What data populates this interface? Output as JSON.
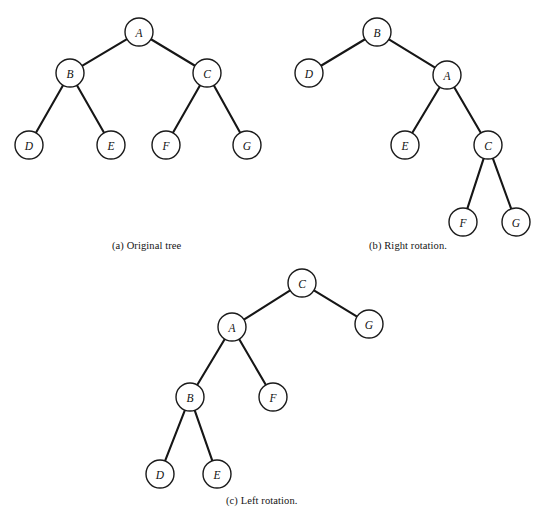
{
  "figure": {
    "background_color": "#ffffff",
    "node_fill_color": "#ffffff",
    "node_stroke_color": "#1a1a1a",
    "edge_color": "#161616",
    "node_radius": 14,
    "panels": [
      {
        "id": "panel-a",
        "caption": "(a) Original tree",
        "caption_position": {
          "x": 112,
          "y": 240
        },
        "nodes": [
          {
            "id": "a-A",
            "label": "A",
            "x": 139,
            "y": 32
          },
          {
            "id": "a-B",
            "label": "B",
            "x": 70,
            "y": 73
          },
          {
            "id": "a-C",
            "label": "C",
            "x": 207,
            "y": 73
          },
          {
            "id": "a-D",
            "label": "D",
            "x": 29,
            "y": 145
          },
          {
            "id": "a-E",
            "label": "E",
            "x": 111,
            "y": 145
          },
          {
            "id": "a-F",
            "label": "F",
            "x": 166,
            "y": 145
          },
          {
            "id": "a-G",
            "label": "G",
            "x": 247,
            "y": 145
          }
        ],
        "edges": [
          {
            "from": "a-A",
            "to": "a-B"
          },
          {
            "from": "a-A",
            "to": "a-C"
          },
          {
            "from": "a-B",
            "to": "a-D"
          },
          {
            "from": "a-B",
            "to": "a-E"
          },
          {
            "from": "a-C",
            "to": "a-F"
          },
          {
            "from": "a-C",
            "to": "a-G"
          }
        ]
      },
      {
        "id": "panel-b",
        "caption": "(b) Right rotation.",
        "caption_position": {
          "x": 369,
          "y": 240
        },
        "nodes": [
          {
            "id": "b-B",
            "label": "B",
            "x": 377,
            "y": 32
          },
          {
            "id": "b-D",
            "label": "D",
            "x": 309,
            "y": 73
          },
          {
            "id": "b-A",
            "label": "A",
            "x": 447,
            "y": 75
          },
          {
            "id": "b-E",
            "label": "E",
            "x": 405,
            "y": 145
          },
          {
            "id": "b-C",
            "label": "C",
            "x": 488,
            "y": 145
          },
          {
            "id": "b-F",
            "label": "F",
            "x": 463,
            "y": 222
          },
          {
            "id": "b-G",
            "label": "G",
            "x": 516,
            "y": 222
          }
        ],
        "edges": [
          {
            "from": "b-B",
            "to": "b-D"
          },
          {
            "from": "b-B",
            "to": "b-A"
          },
          {
            "from": "b-A",
            "to": "b-E"
          },
          {
            "from": "b-A",
            "to": "b-C"
          },
          {
            "from": "b-C",
            "to": "b-F"
          },
          {
            "from": "b-C",
            "to": "b-G"
          }
        ]
      },
      {
        "id": "panel-c",
        "caption": "(c) Left rotation.",
        "caption_position": {
          "x": 226,
          "y": 495
        },
        "nodes": [
          {
            "id": "c-C",
            "label": "C",
            "x": 302,
            "y": 283
          },
          {
            "id": "c-A",
            "label": "A",
            "x": 232,
            "y": 327
          },
          {
            "id": "c-G",
            "label": "G",
            "x": 369,
            "y": 324
          },
          {
            "id": "c-B",
            "label": "B",
            "x": 190,
            "y": 397
          },
          {
            "id": "c-F",
            "label": "F",
            "x": 273,
            "y": 397
          },
          {
            "id": "c-D",
            "label": "D",
            "x": 160,
            "y": 474
          },
          {
            "id": "c-E",
            "label": "E",
            "x": 217,
            "y": 474
          }
        ],
        "edges": [
          {
            "from": "c-C",
            "to": "c-A"
          },
          {
            "from": "c-C",
            "to": "c-G"
          },
          {
            "from": "c-A",
            "to": "c-B"
          },
          {
            "from": "c-A",
            "to": "c-F"
          },
          {
            "from": "c-B",
            "to": "c-D"
          },
          {
            "from": "c-B",
            "to": "c-E"
          }
        ]
      }
    ]
  }
}
